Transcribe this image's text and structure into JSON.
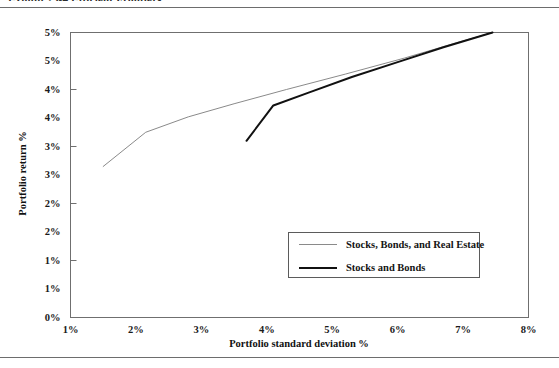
{
  "figure": {
    "caption": "Exhibit 23-4   Efficient Frontiers"
  },
  "chart_data": {
    "type": "line",
    "title": "Exhibit 23-4   Efficient Frontiers",
    "xlabel": "Portfolio standard deviation %",
    "ylabel": "Portfolio return %",
    "xlim": [
      1,
      8
    ],
    "ylim": [
      0,
      5
    ],
    "grid": false,
    "legend_position": "inside-bottom-right",
    "xticks": [
      1,
      2,
      3,
      4,
      5,
      6,
      7,
      8
    ],
    "xtick_labels": [
      "1%",
      "2%",
      "3%",
      "4%",
      "5%",
      "6%",
      "7%",
      "8%"
    ],
    "yticks": [
      0,
      0.5,
      1,
      1.5,
      2,
      2.5,
      3,
      3.5,
      4,
      4.5,
      5
    ],
    "ytick_labels": [
      "0%",
      "1%",
      "1%",
      "2%",
      "2%",
      "3%",
      "3%",
      "4%",
      "4%",
      "5%",
      "5%"
    ],
    "series": [
      {
        "name": "Stocks, Bonds, and Real Estate",
        "color": "#8a8a8a",
        "width": 1,
        "points": [
          [
            1.5,
            2.65
          ],
          [
            2.15,
            3.25
          ],
          [
            2.8,
            3.52
          ],
          [
            3.5,
            3.75
          ],
          [
            4.3,
            4.0
          ],
          [
            5.2,
            4.27
          ],
          [
            6.1,
            4.55
          ],
          [
            6.9,
            4.82
          ],
          [
            7.45,
            5.0
          ]
        ]
      },
      {
        "name": "Stocks and Bonds",
        "color": "#111111",
        "width": 2,
        "points": [
          [
            3.69,
            3.1
          ],
          [
            4.1,
            3.72
          ],
          [
            4.65,
            3.95
          ],
          [
            5.3,
            4.22
          ],
          [
            6.0,
            4.48
          ],
          [
            6.7,
            4.74
          ],
          [
            7.45,
            5.0
          ]
        ]
      }
    ]
  },
  "legend": {
    "entries": [
      {
        "label": "Stocks, Bonds, and Real Estate"
      },
      {
        "label": "Stocks and Bonds"
      }
    ]
  }
}
